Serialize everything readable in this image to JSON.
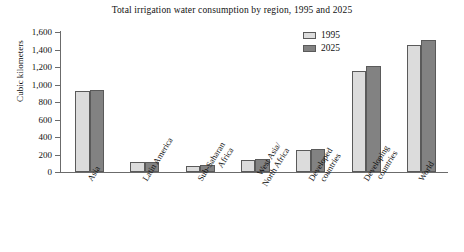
{
  "chart_data": {
    "type": "bar",
    "title": "Total irrigation water consumption by region, 1995 and 2025",
    "xlabel": "",
    "ylabel": "Cubic kilometers",
    "ylim": [
      0,
      1600
    ],
    "ytick_labels": [
      "1,600",
      "1,400",
      "1,200",
      "1,000",
      "800",
      "600",
      "400",
      "200",
      "0"
    ],
    "ytick_values": [
      1600,
      1400,
      1200,
      1000,
      800,
      600,
      400,
      200,
      0
    ],
    "grid": false,
    "legend_position": "top-right",
    "categories": [
      "Asia",
      "Latin America",
      "Sub-Saharan\nAfrica",
      "West Asia/\nNorth Africa",
      "Developed\ncountries",
      "Developing\ncountries",
      "World"
    ],
    "series": [
      {
        "name": "1995",
        "color": "#dcdcdc",
        "values": [
          930,
          110,
          65,
          140,
          250,
          1160,
          1455
        ]
      },
      {
        "name": "2025",
        "color": "#828282",
        "values": [
          935,
          120,
          85,
          150,
          265,
          1210,
          1505
        ]
      }
    ]
  },
  "legend": {
    "items": [
      {
        "label": "1995"
      },
      {
        "label": "2025"
      }
    ]
  }
}
